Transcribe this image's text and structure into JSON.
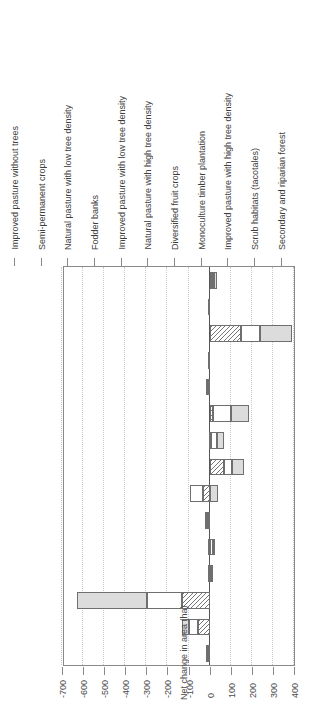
{
  "chart_data": {
    "type": "bar",
    "orientation": "vertical-stacked-rotated",
    "title": "",
    "xlabel": "",
    "ylabel": "Net change in area (ha)",
    "ylim": [
      -700,
      400
    ],
    "yticks": [
      400,
      300,
      200,
      100,
      0,
      -100,
      -200,
      -300,
      -400,
      -500,
      -600,
      -700
    ],
    "ytick_labels": [
      "400",
      "300",
      "200",
      "100",
      "0",
      "-100",
      "-200",
      "-300",
      "-400",
      "-500",
      "-600",
      "-700"
    ],
    "grid": true,
    "legend_position": "bottom",
    "stacked": true,
    "categories": [
      "Secondary and riparian forest",
      "Scrub habitats (tacotales)",
      "Improved pasture with high tree density",
      "Monoculture timber plantation",
      "Diversified fruit crops",
      "Natural pasture with high tree density",
      "Improved pasture with low tree density",
      "Fodder banks",
      "Natural pasture with low tree density",
      "Semi-permanent crops",
      "Improved pasture without trees",
      "Natural pasture without trees",
      "Degraded pasture",
      "Annual crops",
      "Infrastructure, housing and roads"
    ],
    "series": [
      {
        "name": "Extremely poor households",
        "pattern": "diagonal-hatch",
        "values": [
          12,
          2,
          150,
          2,
          -8,
          14,
          6,
          70,
          -30,
          -8,
          -10,
          -8,
          -130,
          -55,
          -5
        ]
      },
      {
        "name": "Poor households",
        "pattern": "white",
        "values": [
          9,
          1,
          90,
          1,
          -2,
          88,
          28,
          38,
          -62,
          -4,
          16,
          8,
          -165,
          -45,
          -3
        ]
      },
      {
        "name": "Non-poor households",
        "pattern": "light-grey",
        "values": [
          13,
          1,
          150,
          1,
          -1,
          84,
          35,
          56,
          38,
          -3,
          10,
          6,
          -335,
          -30,
          -2
        ]
      }
    ]
  },
  "legend": {
    "items": [
      {
        "label": "Extremely poor households",
        "style": "ext"
      },
      {
        "label": "Poor households",
        "style": "poor"
      },
      {
        "label": "Non-poor households",
        "style": "nonpoor"
      }
    ]
  },
  "colors": {
    "extremely_poor": "#777777",
    "poor": "#ffffff",
    "non_poor": "#dcdcdc",
    "axis": "#8a8a8a",
    "grid": "#c9c9c9",
    "text": "#3d3d3d"
  }
}
